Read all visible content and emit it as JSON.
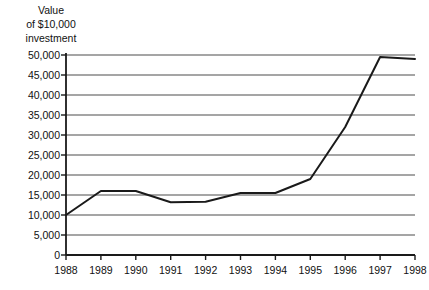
{
  "chart_data": {
    "type": "line",
    "title": "Value\nof $10,000\ninvestment",
    "title_lines": [
      "Value",
      "of $10,000",
      "investment"
    ],
    "xlabel": "",
    "ylabel": "Value of $10,000 investment",
    "x": [
      1988,
      1989,
      1990,
      1991,
      1992,
      1993,
      1994,
      1995,
      1996,
      1997,
      1998
    ],
    "categories": [
      "1988",
      "1989",
      "1990",
      "1991",
      "1992",
      "1993",
      "1994",
      "1995",
      "1996",
      "1997",
      "1998"
    ],
    "values": [
      10000,
      16000,
      16000,
      13200,
      13300,
      15500,
      15500,
      19000,
      32000,
      49500,
      49000
    ],
    "series": [
      {
        "name": "Value of $10,000 investment",
        "values": [
          10000,
          16000,
          16000,
          13200,
          13300,
          15500,
          15500,
          19000,
          32000,
          49500,
          49000
        ]
      }
    ],
    "ylim": [
      0,
      50000
    ],
    "xlim": [
      1988,
      1998
    ],
    "yticks": [
      0,
      5000,
      10000,
      15000,
      20000,
      25000,
      30000,
      35000,
      40000,
      45000,
      50000
    ],
    "ytick_labels": [
      "0",
      "5,000",
      "10,000",
      "15,000",
      "20,000",
      "25,000",
      "30,000",
      "35,000",
      "40,000",
      "45,000",
      "50,000"
    ],
    "xticks": [
      1988,
      1989,
      1990,
      1991,
      1992,
      1993,
      1994,
      1995,
      1996,
      1997,
      1998
    ],
    "xtick_labels": [
      "1988",
      "1989",
      "1990",
      "1991",
      "1992",
      "1993",
      "1994",
      "1995",
      "1996",
      "1997",
      "1998"
    ],
    "grid": true,
    "grid_axis": "y",
    "legend": false,
    "legend_position": "none",
    "line_color": "#1a1a1a",
    "grid_color": "#4d4d4d",
    "axis_color": "#1a1a1a",
    "background_color": "#ffffff"
  }
}
